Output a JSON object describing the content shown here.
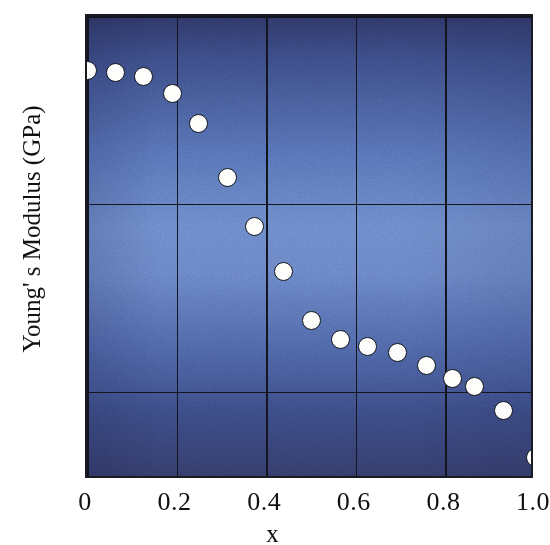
{
  "chart_data": {
    "type": "scatter",
    "title": "",
    "xlabel": "x",
    "ylabel": "Young' s Modulus (GPa)",
    "xlim": [
      0,
      1.0
    ],
    "ylim": [
      265.3,
      290
    ],
    "xticks": [
      "0",
      "0.2",
      "0.4",
      "0.6",
      "0.8",
      "1.0"
    ],
    "xtick_values": [
      0,
      0.2,
      0.4,
      0.6,
      0.8,
      1.0
    ],
    "yticks": [
      "290",
      "280",
      "270"
    ],
    "ytick_values": [
      290,
      280,
      270
    ],
    "grid": true,
    "legend": null,
    "marker": {
      "shape": "circle",
      "fill": "#fdfdfb",
      "edge": "#15161c",
      "size_px": 19
    },
    "background": {
      "style": "vertical-gradient",
      "top": "#2e3564",
      "middle": "#6b87c9",
      "bottom": "#333a68"
    },
    "series": [
      {
        "name": "Young's Modulus vs x",
        "points": [
          {
            "x": 0.0,
            "y": 287.1
          },
          {
            "x": 0.063,
            "y": 287.0
          },
          {
            "x": 0.127,
            "y": 286.8
          },
          {
            "x": 0.19,
            "y": 285.9
          },
          {
            "x": 0.248,
            "y": 284.3
          },
          {
            "x": 0.313,
            "y": 281.4
          },
          {
            "x": 0.373,
            "y": 278.8
          },
          {
            "x": 0.438,
            "y": 276.4
          },
          {
            "x": 0.502,
            "y": 273.8
          },
          {
            "x": 0.565,
            "y": 272.8
          },
          {
            "x": 0.625,
            "y": 272.4
          },
          {
            "x": 0.692,
            "y": 272.1
          },
          {
            "x": 0.757,
            "y": 271.4
          },
          {
            "x": 0.815,
            "y": 270.7
          },
          {
            "x": 0.866,
            "y": 270.3
          },
          {
            "x": 0.93,
            "y": 269.0
          },
          {
            "x": 1.0,
            "y": 266.5
          }
        ]
      }
    ]
  }
}
